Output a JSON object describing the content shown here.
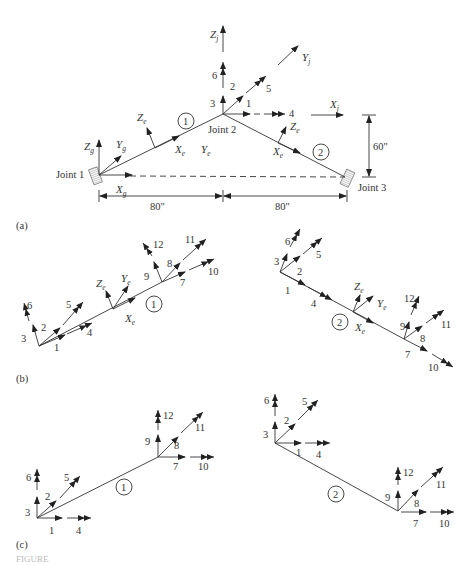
{
  "figure": {
    "panel_labels": [
      "(a)",
      "(b)",
      "(c)"
    ],
    "caption_label": "FIGURE"
  },
  "panel_a": {
    "joints": [
      "Joint 1",
      "Joint 2",
      "Joint 3"
    ],
    "members": [
      "1",
      "2"
    ],
    "global_axes": {
      "x": "X",
      "y": "Y",
      "z": "Z",
      "subscript": "g"
    },
    "joint_axes": {
      "x": "X",
      "y": "Y",
      "z": "Z",
      "subscript": "j"
    },
    "element_axes": {
      "x": "X",
      "y": "Y",
      "z": "Z",
      "subscript": "e"
    },
    "joint2_dofs": [
      "1",
      "2",
      "3",
      "4",
      "5",
      "6"
    ],
    "dimensions": {
      "left_span": "80\"",
      "right_span": "80\"",
      "height": "60\""
    }
  },
  "panel_b": {
    "member1": {
      "label": "1",
      "dofs": [
        "1",
        "2",
        "3",
        "4",
        "5",
        "6",
        "7",
        "8",
        "9",
        "10",
        "11",
        "12"
      ],
      "axes": {
        "x": "X",
        "y": "Y",
        "z": "Z",
        "subscript": "e"
      }
    },
    "member2": {
      "label": "2",
      "dofs": [
        "1",
        "2",
        "3",
        "4",
        "5",
        "6",
        "7",
        "8",
        "9",
        "10",
        "11",
        "12"
      ],
      "axes": {
        "x": "X",
        "y": "Y",
        "z": "Z",
        "subscript": "e"
      }
    }
  },
  "panel_c": {
    "member1": {
      "label": "1",
      "dofs": [
        "1",
        "2",
        "3",
        "4",
        "5",
        "6",
        "7",
        "8",
        "9",
        "10",
        "11",
        "12"
      ]
    },
    "member2": {
      "label": "2",
      "dofs": [
        "1",
        "2",
        "3",
        "4",
        "5",
        "6",
        "7",
        "8",
        "9",
        "10",
        "11",
        "12"
      ]
    }
  }
}
